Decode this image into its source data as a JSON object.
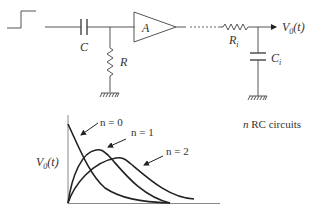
{
  "circuit": {
    "input_symbol": "step-input",
    "capacitor_label": "C",
    "resistor_label": "R",
    "amplifier_label": "A",
    "stage_resistor_label": "R",
    "stage_resistor_sub": "i",
    "stage_capacitor_label": "C",
    "stage_capacitor_sub": "i",
    "output_label": "V",
    "output_sub": "0",
    "output_arg": "(t)",
    "caption_n": "n",
    "caption_rest": " RC circuits"
  },
  "plot": {
    "ylabel": "V",
    "ylabel_sub": "0",
    "ylabel_arg": "(t)",
    "legend": [
      {
        "label": "n = 0"
      },
      {
        "label": "n = 1"
      },
      {
        "label": "n = 2"
      }
    ]
  },
  "colors": {
    "line": "#555555",
    "curve": "#222222",
    "background": "#ffffff"
  }
}
